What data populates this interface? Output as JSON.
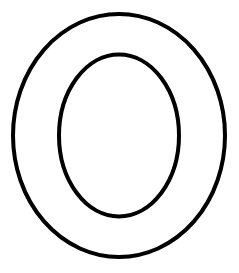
{
  "figure": {
    "letter": "O",
    "background": "#ffffff",
    "stroke_color": "#000000",
    "stroke_width": 4,
    "outer_ellipse": {
      "cx": 119,
      "cy": 135.5,
      "rx": 106,
      "ry": 121.5
    },
    "inner_ellipse": {
      "cx": 119,
      "cy": 135.5,
      "rx": 60,
      "ry": 81
    }
  }
}
